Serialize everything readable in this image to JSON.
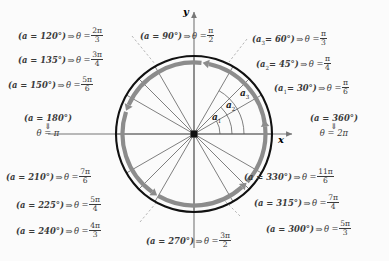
{
  "figure": {
    "center": {
      "x": 194,
      "y": 134
    },
    "radius": 78,
    "background_color": "#fbfbfb",
    "circle_color": "#111111",
    "ring_color": "#8c8c8c",
    "radial_line_color": "#555555",
    "axis_color": "#777777"
  },
  "axes": {
    "x_label": "x",
    "y_label": "y"
  },
  "alpha_arcs": [
    {
      "name": "alpha-1",
      "label": "a",
      "sub": "1",
      "degrees": 30
    },
    {
      "name": "alpha-2",
      "label": "a",
      "sub": "2",
      "degrees": 45
    },
    {
      "name": "alpha-3",
      "label": "a",
      "sub": "3",
      "degrees": 60
    }
  ],
  "chart_data": {
    "type": "scatter",
    "xlabel": "x",
    "ylabel": "y",
    "grid": false,
    "legend": "none",
    "angles_degrees": [
      30,
      45,
      60,
      90,
      120,
      135,
      150,
      180,
      210,
      225,
      240,
      270,
      300,
      315,
      330,
      360
    ],
    "radians_text": [
      "pi/6",
      "pi/4",
      "pi/3",
      "pi/2",
      "2pi/3",
      "3pi/4",
      "5pi/6",
      "pi",
      "7pi/6",
      "5pi/4",
      "4pi/3",
      "3pi/2",
      "5pi/3",
      "7pi/4",
      "11pi/6",
      "2pi"
    ],
    "radial_lines_degrees": [
      0,
      30,
      45,
      60,
      90,
      120,
      135,
      150,
      180,
      210,
      225,
      240,
      270,
      300,
      315,
      330
    ],
    "direction": "counterclockwise"
  },
  "labels": {
    "deg120": {
      "angle": "(a = 120°)",
      "arrow": "⇒",
      "theta": "θ =",
      "num": "2π",
      "den": "3"
    },
    "deg135": {
      "angle": "(a = 135°)",
      "arrow": "⇒",
      "theta": "θ =",
      "num": "3π",
      "den": "4"
    },
    "deg150": {
      "angle": "(a = 150°)",
      "arrow": "⇒",
      "theta": "θ =",
      "num": "5π",
      "den": "6"
    },
    "deg90": {
      "angle": "(a = 90°)",
      "arrow": "⇒",
      "theta": "θ =",
      "num": "π",
      "den": "2"
    },
    "deg60": {
      "angle": "(a",
      "sub": "3",
      "rest": "= 60°)",
      "arrow": "⇒",
      "theta": "θ =",
      "num": "π",
      "den": "3"
    },
    "deg45": {
      "angle": "(a",
      "sub": "2",
      "rest": "= 45°)",
      "arrow": "⇒",
      "theta": "θ =",
      "num": "π",
      "den": "4"
    },
    "deg30": {
      "angle": "(a",
      "sub": "1",
      "rest": "= 30°)",
      "arrow": "⇒",
      "theta": "θ =",
      "num": "π",
      "den": "6"
    },
    "deg180": {
      "angle": "(a = 180°)",
      "dbl": "⇓",
      "theta": "θ = π"
    },
    "deg360": {
      "angle": "(a = 360°)",
      "dbl": "⇓",
      "theta": "θ = 2π"
    },
    "deg210": {
      "angle": "(a = 210°)",
      "arrow": "⇒",
      "theta": "θ =",
      "num": "7π",
      "den": "6"
    },
    "deg225": {
      "angle": "(a = 225°)",
      "arrow": "⇒",
      "theta": "θ =",
      "num": "5π",
      "den": "4"
    },
    "deg240": {
      "angle": "(a = 240°)",
      "arrow": "⇒",
      "theta": "θ =",
      "num": "4π",
      "den": "3"
    },
    "deg270": {
      "angle": "(a = 270°)",
      "arrow": "⇒",
      "theta": "θ =",
      "num": "3π",
      "den": "2"
    },
    "deg330": {
      "angle": "(a = 330°)",
      "arrow": "⇒",
      "theta": "θ =",
      "num": "11π",
      "den": "6"
    },
    "deg315": {
      "angle": "(a = 315°)",
      "arrow": "⇒",
      "theta": "θ =",
      "num": "7π",
      "den": "4"
    },
    "deg300": {
      "angle": "(a = 300°)",
      "arrow": "⇒",
      "theta": "θ =",
      "num": "5π",
      "den": "3"
    }
  }
}
